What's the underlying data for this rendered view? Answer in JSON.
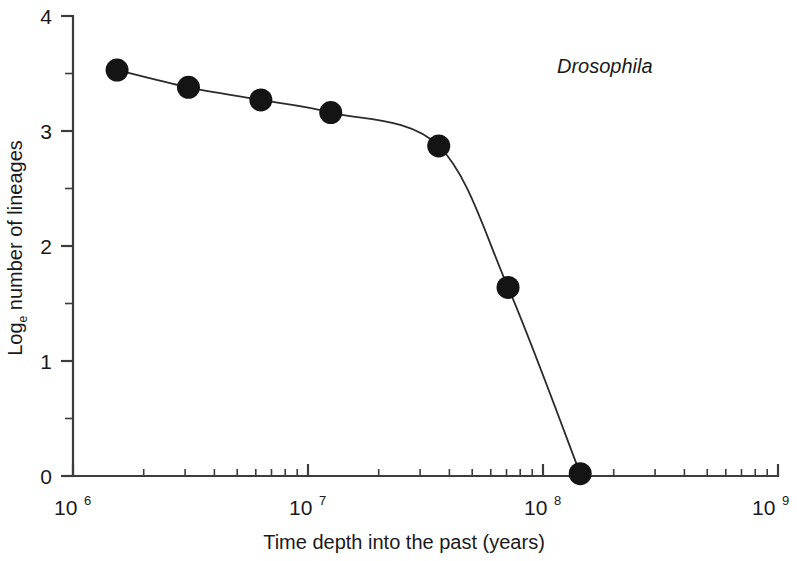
{
  "chart_data": {
    "type": "line",
    "title": "",
    "annotation": "Drosophila",
    "xlabel": "Time depth into the past (years)",
    "ylabel": "Log",
    "ylabel_sub": "e",
    "ylabel_rest": " number of lineages",
    "xscale": "log",
    "xlim": [
      1000000,
      1000000000
    ],
    "ylim": [
      0,
      4
    ],
    "grid": false,
    "legend": null,
    "x_tick_labels": [
      "10",
      "10",
      "10",
      "10"
    ],
    "x_tick_exponents": [
      "6",
      "7",
      "8",
      "9"
    ],
    "x_tick_values": [
      1000000,
      10000000,
      100000000,
      1000000000
    ],
    "y_tick_labels": [
      "0",
      "1",
      "2",
      "3",
      "4"
    ],
    "y_tick_values": [
      0,
      1,
      2,
      3,
      4
    ],
    "y_minor_ticks": [
      0.5,
      1.5,
      2.5,
      3.5
    ],
    "marker": "filled-circle",
    "marker_color": "#141414",
    "line_color": "#2b2b2b",
    "series": [
      {
        "name": "Drosophila",
        "x": [
          1540000,
          3100000,
          6300000,
          12500000,
          36000000,
          71000000,
          144000000
        ],
        "y": [
          3.53,
          3.38,
          3.27,
          3.16,
          2.87,
          1.64,
          0.02
        ]
      }
    ]
  },
  "figure": {
    "background": "#ffffff",
    "axis_color": "#3c3c3c"
  }
}
